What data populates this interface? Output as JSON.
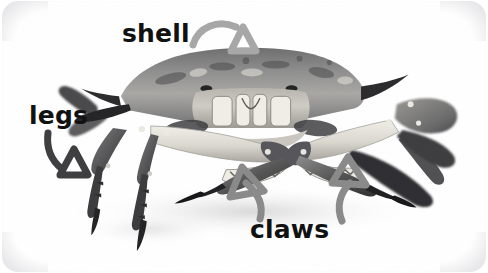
{
  "figure": {
    "view": "front view photograph of a crab, grayscale",
    "background_color": "#ffffff",
    "card_corner_radius_px": 16,
    "width_px": 488,
    "height_px": 273
  },
  "annotations": [
    {
      "id": "shell",
      "label": "shell",
      "label_color": "#111111",
      "arrow_color": "#a7a7a7",
      "arrow_head": "open-triangle",
      "points_to": "carapace (top of body)",
      "label_position": {
        "x": 120,
        "y": 20
      },
      "arrow_tip": {
        "x": 247,
        "y": 50
      }
    },
    {
      "id": "legs",
      "label": "legs",
      "label_color": "#111111",
      "arrow_color": "#4a4a4a",
      "arrow_head": "open-triangle",
      "points_to": "walking legs (lower left)",
      "label_position": {
        "x": 27,
        "y": 102
      },
      "arrow_tip": {
        "x": 86,
        "y": 178
      }
    },
    {
      "id": "claws",
      "label": "claws",
      "label_color": "#111111",
      "arrow_color": "#8a8a8a",
      "arrow_head": "open-triangle",
      "points_to": "both pincers / chelae",
      "label_position": {
        "x": 248,
        "y": 216
      },
      "arrow_tips": [
        {
          "x": 239,
          "y": 169
        },
        {
          "x": 340,
          "y": 160
        }
      ]
    }
  ],
  "icons": {
    "arrow_shell": "curved-arrow-icon",
    "arrow_legs": "curved-arrow-icon",
    "arrow_claw_left": "curved-arrow-icon",
    "arrow_claw_right": "curved-arrow-icon"
  },
  "palette": {
    "ink": "#111111",
    "arrow_light_gray": "#a7a7a7",
    "arrow_mid_gray": "#8a8a8a",
    "arrow_dark_gray": "#4a4a4a",
    "card_white": "#ffffff",
    "edge_gray": "#e2e2e5"
  }
}
